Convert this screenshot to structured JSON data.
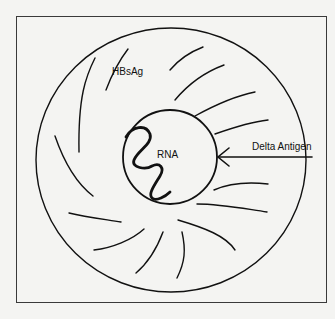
{
  "diagram": {
    "labels": {
      "surface_antigen": "HBsAg",
      "core_nucleic_acid": "RNA",
      "delta_antigen": "Delta Antigen"
    },
    "colors": {
      "background": "#f4f4f2",
      "line": "#111111",
      "frame": "#3a3a3a"
    },
    "components": [
      {
        "name": "outer-envelope",
        "shape": "circle",
        "label": "HBsAg"
      },
      {
        "name": "inner-core",
        "shape": "circle",
        "label": "Delta Antigen"
      },
      {
        "name": "genome",
        "shape": "squiggle",
        "label": "RNA"
      }
    ]
  },
  "caption": {
    "text": ""
  }
}
